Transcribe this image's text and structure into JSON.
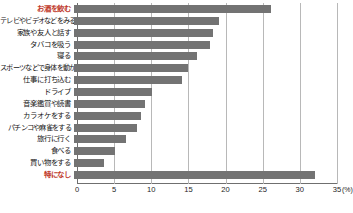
{
  "chart_data": {
    "type": "bar",
    "orientation": "horizontal",
    "title": "",
    "xlabel": "(%)",
    "ylabel": "",
    "unit": "(%)",
    "xlim": [
      0,
      35
    ],
    "xticks": [
      0,
      5,
      10,
      15,
      20,
      25,
      30,
      35
    ],
    "xtick_labels": [
      "0",
      "5",
      "10",
      "15",
      "20",
      "25",
      "30",
      "35"
    ],
    "grid": true,
    "legend": false,
    "bar_color": "#737373",
    "accent_color": "#c0392b",
    "categories": [
      "お酒を飲む",
      "テレビやビデオなどをみる",
      "家族や友人と話す",
      "タバコを吸う",
      "寝る",
      "スポーツなどで身体を動かす",
      "仕事に打ち込む",
      "ドライブ",
      "音楽鑑賞や読書",
      "カラオケをする",
      "パチンコや麻雀をする",
      "旅行に行く",
      "食べる",
      "買い物をする",
      "特になし"
    ],
    "values": [
      26.5,
      19.5,
      18.7,
      18.3,
      16.5,
      15.3,
      14.5,
      10.5,
      9.5,
      9.0,
      8.5,
      7.0,
      5.5,
      4.0,
      32.5
    ],
    "emphasis": [
      0,
      14
    ]
  }
}
